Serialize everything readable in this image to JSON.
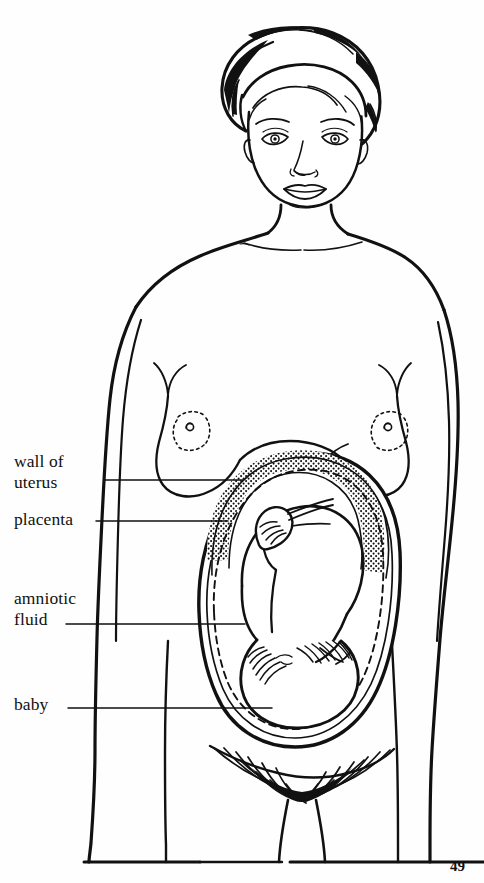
{
  "page": {
    "number": "49",
    "background_color": "#fefefe",
    "ink_color": "#111111",
    "width": 484,
    "height": 883
  },
  "figure": {
    "style": "black-and-white line drawing"
  },
  "labels": [
    {
      "id": "wall-of-uterus",
      "line1": "wall of",
      "line2": "uterus",
      "leader": {
        "x1": 104,
        "y1": 480,
        "x2": 243,
        "y2": 480
      }
    },
    {
      "id": "placenta",
      "line1": "placenta",
      "line2": "",
      "leader": {
        "x1": 96,
        "y1": 521,
        "x2": 228,
        "y2": 521
      }
    },
    {
      "id": "amniotic-fluid",
      "line1": "amniotic",
      "line2": "fluid",
      "leader": {
        "x1": 66,
        "y1": 624,
        "x2": 245,
        "y2": 624
      }
    },
    {
      "id": "baby",
      "line1": "baby",
      "line2": "",
      "leader": {
        "x1": 68,
        "y1": 708,
        "x2": 272,
        "y2": 708
      }
    }
  ],
  "anatomy_parts": [
    "wall of uterus",
    "placenta",
    "amniotic fluid",
    "baby",
    "umbilical cord",
    "breast",
    "head",
    "legs"
  ]
}
